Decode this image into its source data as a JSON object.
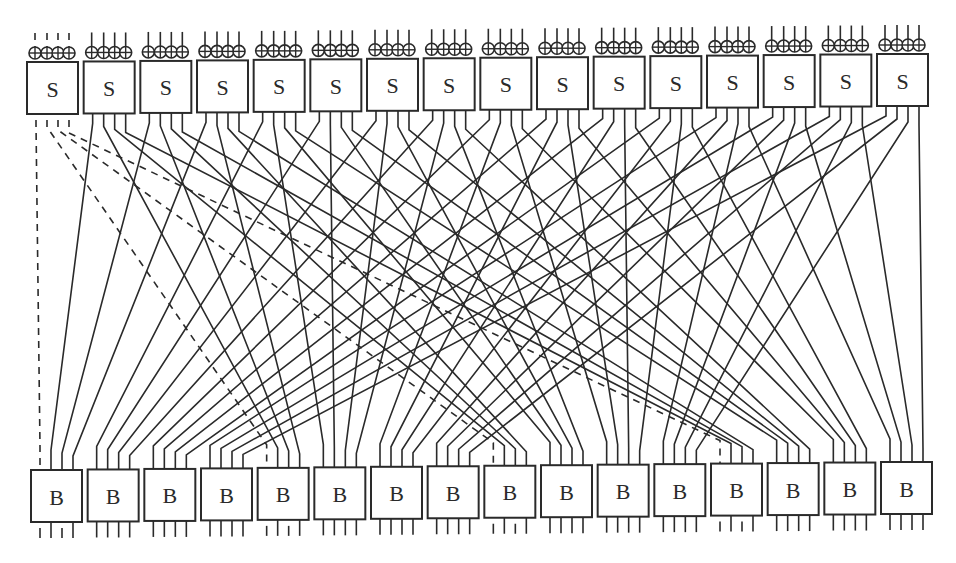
{
  "diagram": {
    "title": "",
    "sbox_row": {
      "count": 16,
      "label": "S",
      "first": {
        "x": 27,
        "y": 62
      },
      "last": {
        "x": 877,
        "y": 54
      },
      "width": 51,
      "height": 52,
      "pin_offsets": [
        9,
        20,
        31,
        42
      ],
      "xor_offset_above": 9,
      "xor_radius": 6,
      "input_line_length": 22,
      "dashed_boxes": [
        0
      ]
    },
    "bbox_row": {
      "count": 16,
      "label": "B",
      "first": {
        "x": 31,
        "y": 470
      },
      "last": {
        "x": 881,
        "y": 462
      },
      "width": 51,
      "height": 52,
      "pin_offsets": [
        9,
        20,
        31,
        42
      ],
      "output_line_length": 16,
      "dashed_output_boxes": [
        0,
        4,
        8,
        12
      ]
    },
    "permutation": {
      "description": "S-box i output bit j connects to B-box (4*j + floor(i/4)) input bit (i mod 4)",
      "dashed_source_sbox": 0
    },
    "labels": {
      "sboxes": [
        "S",
        "S",
        "S",
        "S",
        "S",
        "S",
        "S",
        "S",
        "S",
        "S",
        "S",
        "S",
        "S",
        "S",
        "S",
        "S"
      ],
      "bboxes": [
        "B",
        "B",
        "B",
        "B",
        "B",
        "B",
        "B",
        "B",
        "B",
        "B",
        "B",
        "B",
        "B",
        "B",
        "B",
        "B"
      ]
    },
    "colors": {
      "ink": "#2a2a2a",
      "background": "#ffffff"
    }
  }
}
